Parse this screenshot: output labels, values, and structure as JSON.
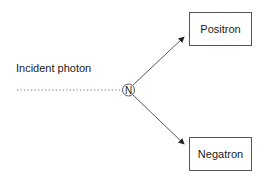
{
  "diagram": {
    "incident_label": "Incident photon",
    "nucleus_symbol": "N",
    "products": [
      {
        "label": "Positron"
      },
      {
        "label": "Negatron"
      }
    ]
  }
}
